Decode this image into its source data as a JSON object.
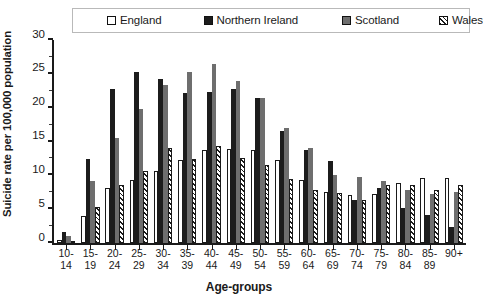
{
  "chart_data": {
    "type": "bar",
    "title": "",
    "xlabel": "Age-groups",
    "ylabel": "Suicide rate per 100,000 population",
    "ylim": [
      0,
      30
    ],
    "yticks": [
      0,
      5,
      10,
      15,
      20,
      25,
      30
    ],
    "grid": false,
    "legend_position": "top",
    "categories": [
      "10-14",
      "15-19",
      "20-24",
      "25-29",
      "30-34",
      "35-39",
      "40-44",
      "45-49",
      "50-54",
      "55-59",
      "60-64",
      "65-69",
      "70-74",
      "75-79",
      "80-84",
      "85-89",
      "90+"
    ],
    "series": [
      {
        "name": "England",
        "color": "#ffffff",
        "pattern": "solid-outline",
        "values": [
          0.5,
          4.0,
          8.2,
          9.3,
          10.6,
          12.3,
          13.8,
          13.9,
          13.8,
          12.2,
          9.3,
          7.5,
          7.1,
          7.3,
          8.8,
          9.6,
          9.6
        ]
      },
      {
        "name": "Northern Ireland",
        "color": "#1c1c1c",
        "pattern": "solid",
        "values": [
          1.7,
          12.4,
          22.8,
          25.3,
          24.3,
          22.2,
          22.3,
          22.7,
          21.5,
          16.6,
          13.8,
          12.1,
          6.4,
          8.1,
          5.2,
          4.2,
          2.4
        ]
      },
      {
        "name": "Scotland",
        "color": "#6e6e6e",
        "pattern": "solid",
        "values": [
          1.0,
          9.1,
          15.5,
          19.8,
          23.3,
          25.3,
          26.5,
          24.0,
          21.4,
          17.0,
          14.0,
          10.0,
          9.8,
          9.2,
          7.9,
          7.2,
          7.5
        ]
      },
      {
        "name": "Wales",
        "color": "#ffffff",
        "pattern": "diagonal-hatch",
        "values": [
          0.1,
          5.3,
          8.5,
          10.7,
          14.0,
          12.4,
          14.3,
          12.5,
          11.6,
          9.4,
          7.9,
          7.4,
          6.3,
          8.6,
          8.6,
          7.9,
          8.5
        ]
      }
    ]
  },
  "legend": {
    "items": [
      {
        "label": "England"
      },
      {
        "label": "Northern Ireland"
      },
      {
        "label": "Scotland"
      },
      {
        "label": "Wales"
      }
    ]
  }
}
